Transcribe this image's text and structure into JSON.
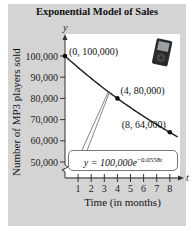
{
  "chart_data": {
    "type": "line",
    "title": "Exponential Model of Sales",
    "xlabel": "Time (in months)",
    "ylabel": "Number of MP3 players sold",
    "x_axis_symbol": "t",
    "y_axis_symbol": "y",
    "x_ticks": [
      "1",
      "2",
      "3",
      "4",
      "5",
      "6",
      "7",
      "8"
    ],
    "y_ticks": [
      "50,000",
      "60,000",
      "70,000",
      "80,000",
      "90,000",
      "100,000"
    ],
    "xlim": [
      0,
      8.5
    ],
    "ylim": [
      50000,
      100000
    ],
    "y_axis_break": true,
    "grid": false,
    "equation": "y = 100,000e^{-0.0558t}",
    "equation_parts": {
      "lhs": "y = 100,000",
      "base": "e",
      "exponent": "−0.0558t"
    },
    "series": [
      {
        "name": "y = 100,000e^(-0.0558t)",
        "x": [
          0,
          1,
          2,
          3,
          4,
          5,
          6,
          7,
          8
        ],
        "values": [
          100000,
          94572,
          89438,
          84584,
          80000,
          75651,
          71545,
          67662,
          64000
        ]
      }
    ],
    "labeled_points": [
      {
        "x": 0,
        "y": 100000,
        "label": "(0, 100,000)"
      },
      {
        "x": 4,
        "y": 80000,
        "label": "(4, 80,000)"
      },
      {
        "x": 8,
        "y": 64000,
        "label": "(8, 64,000)"
      }
    ],
    "image": "mp3-player-icon"
  }
}
